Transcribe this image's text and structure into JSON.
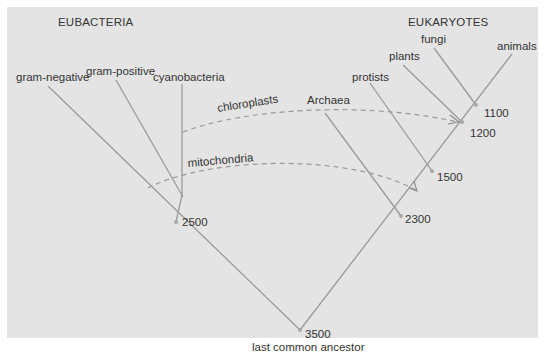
{
  "diagram": {
    "type": "phylogenetic-tree",
    "groups": {
      "left": "EUBACTERIA",
      "right": "EUKARYOTES"
    },
    "root": {
      "age": "3500",
      "label": "last common ancestor"
    },
    "nodes": [
      {
        "id": "eubacteria-split",
        "age": "2500"
      },
      {
        "id": "archaea-eukaryote-split",
        "age": "2300"
      },
      {
        "id": "protist-split",
        "age": "1500"
      },
      {
        "id": "plant-split",
        "age": "1200"
      },
      {
        "id": "fungi-animal-split",
        "age": "1100"
      }
    ],
    "leaves": [
      {
        "id": "gram-negative",
        "label": "gram-negative"
      },
      {
        "id": "gram-positive",
        "label": "gram-positive"
      },
      {
        "id": "cyanobacteria",
        "label": "cyanobacteria"
      },
      {
        "id": "archaea",
        "label": "Archaea"
      },
      {
        "id": "protists",
        "label": "protists"
      },
      {
        "id": "plants",
        "label": "plants"
      },
      {
        "id": "fungi",
        "label": "fungi"
      },
      {
        "id": "animals",
        "label": "animals"
      }
    ],
    "transfers": [
      {
        "id": "chloroplasts",
        "label": "chloroplasts",
        "from": "cyanobacteria",
        "to": "plant-split"
      },
      {
        "id": "mitochondria",
        "label": "mitochondria",
        "from": "cyanobacteria",
        "to": "archaea-eukaryote-split"
      }
    ],
    "colors": {
      "background": "#e4e4e4",
      "line": "#9a9a9a",
      "text": "#333333"
    }
  }
}
